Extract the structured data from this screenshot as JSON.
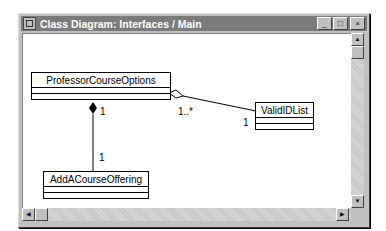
{
  "window": {
    "title": "Class Diagram: Interfaces / Main",
    "buttons": {
      "minimize": "_",
      "maximize": "□",
      "close": "×"
    }
  },
  "diagram": {
    "classes": [
      {
        "name": "ProfessorCourseOptions"
      },
      {
        "name": "ValidIDList"
      },
      {
        "name": "AddACourseOffering"
      }
    ],
    "relationships": [
      {
        "type": "composition",
        "from": "ProfessorCourseOptions",
        "to": "AddACourseOffering",
        "from_multiplicity": "1",
        "to_multiplicity": "1"
      },
      {
        "type": "aggregation",
        "from": "ProfessorCourseOptions",
        "to": "ValidIDList",
        "from_multiplicity": "1..*",
        "to_multiplicity": "1"
      }
    ]
  },
  "scrollbars": {
    "up_arrow": "▲",
    "down_arrow": "▼",
    "left_arrow": "◀",
    "right_arrow": "▶"
  }
}
